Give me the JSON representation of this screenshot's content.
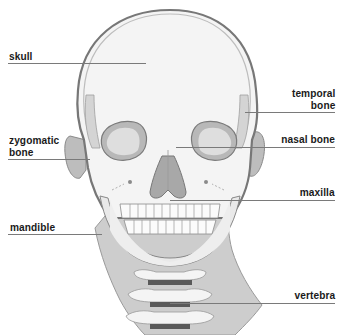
{
  "diagram": {
    "colors": {
      "background": "#ffffff",
      "bone_fill": "#f3f3f3",
      "bone_shade": "#c4c4c4",
      "outline": "#7d7d7d",
      "dark_outline": "#555555",
      "soft_tissue": "#cfcfcf",
      "disc": "#5a5a5a",
      "leader_line": "#7a7a7a",
      "label_text": "#1a1a1a"
    },
    "labels": [
      {
        "id": "skull",
        "line1": "skull",
        "line2": "",
        "side": "left"
      },
      {
        "id": "zygomatic-bone",
        "line1": "zygomatic",
        "line2": "bone",
        "side": "left"
      },
      {
        "id": "mandible",
        "line1": "mandible",
        "line2": "",
        "side": "left"
      },
      {
        "id": "temporal-bone",
        "line1": "temporal",
        "line2": "bone",
        "side": "right"
      },
      {
        "id": "nasal-bone",
        "line1": "nasal bone",
        "line2": "",
        "side": "right"
      },
      {
        "id": "maxilla",
        "line1": "maxilla",
        "line2": "",
        "side": "right"
      },
      {
        "id": "vertebra",
        "line1": "vertebra",
        "line2": "",
        "side": "right"
      }
    ]
  }
}
